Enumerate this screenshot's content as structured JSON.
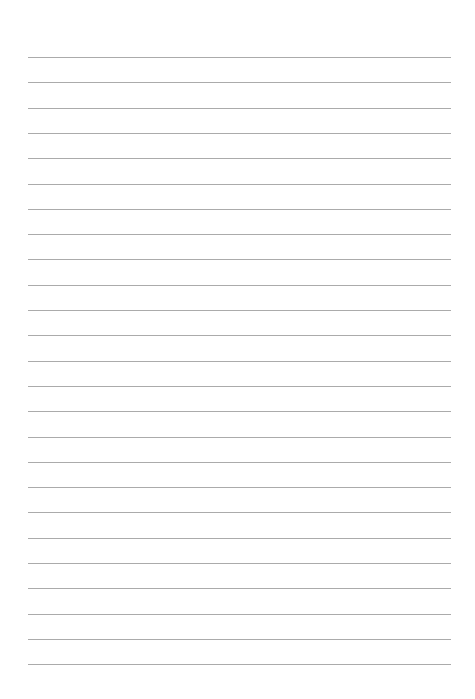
{
  "page": {
    "type": "lined-paper",
    "background_color": "#ffffff",
    "line_color": "#ababab",
    "line_count": 25,
    "first_line_y": 57,
    "line_spacing": 25.3,
    "line_left": 28,
    "line_right": 451,
    "text_content": []
  }
}
